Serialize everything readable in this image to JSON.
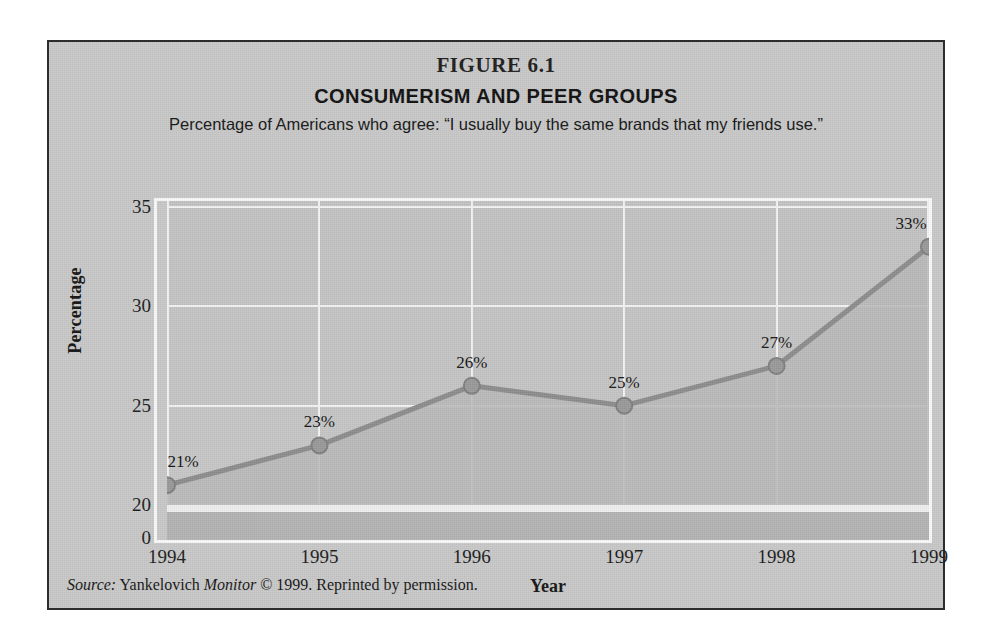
{
  "figure": {
    "number": "FIGURE 6.1",
    "title": "CONSUMERISM AND PEER GROUPS",
    "subtitle": "Percentage of Americans who agree: “I usually buy the same brands that my friends use.”",
    "source_prefix": "Source:",
    "source_name_1": "Yankelovich",
    "source_name_2": "Monitor",
    "source_rest": "© 1999. Reprinted by permission.",
    "background_color": "#c9c9c9",
    "border_color": "#2c2c2c"
  },
  "chart_data": {
    "type": "line",
    "title": "CONSUMERISM AND PEER GROUPS",
    "subtitle": "Percentage of Americans who agree: “I usually buy the same brands that my friends use.”",
    "xlabel": "Year",
    "ylabel": "Percentage",
    "categories": [
      "1994",
      "1995",
      "1996",
      "1997",
      "1998",
      "1999"
    ],
    "values": [
      21,
      23,
      26,
      25,
      27,
      33
    ],
    "point_labels": [
      "21%",
      "23%",
      "26%",
      "25%",
      "27%",
      "33%"
    ],
    "ytick_labels": [
      "35",
      "30",
      "25",
      "20",
      "0"
    ],
    "ytick_values": [
      35,
      30,
      25,
      20,
      0
    ],
    "ylim": [
      20,
      35
    ],
    "axis_break": true,
    "grid": true,
    "legend": "none",
    "series_color": "#8d8d8d",
    "marker_color": "#9a9a9a",
    "area_fill_color": "#b9b9b9",
    "gridline_color": "#f4f4f4"
  }
}
